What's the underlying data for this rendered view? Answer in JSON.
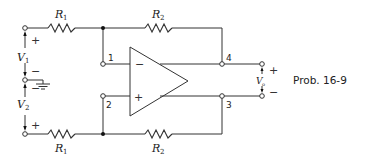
{
  "caption": "Prob. 16-9",
  "resistors": {
    "top_left": {
      "name": "R",
      "sub": "1"
    },
    "top_right": {
      "name": "R",
      "sub": "2"
    },
    "bottom_left": {
      "name": "R",
      "sub": "1"
    },
    "bottom_right": {
      "name": "R",
      "sub": "2"
    }
  },
  "sources": {
    "v1": {
      "name": "V",
      "sub": "1",
      "plus": "+",
      "minus": "−"
    },
    "v2": {
      "name": "V",
      "sub": "2",
      "plus": "+",
      "minus": "−"
    }
  },
  "output": {
    "name": "V",
    "sub": "o",
    "plus": "+",
    "minus": "−"
  },
  "opamp": {
    "inverting": "−",
    "noninverting": "+"
  },
  "nodes": {
    "n1": "1",
    "n2": "2",
    "n3": "3",
    "n4": "4"
  },
  "colors": {
    "line": "#333333",
    "background": "#ffffff"
  }
}
